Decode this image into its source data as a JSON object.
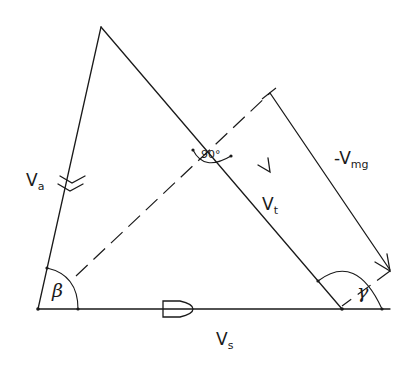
{
  "diagram": {
    "type": "velocity-triangle",
    "labels": {
      "va": {
        "main": "V",
        "sub": "a"
      },
      "vt": {
        "main": "V",
        "sub": "t"
      },
      "vs": {
        "main": "V",
        "sub": "s"
      },
      "vmg": {
        "main": "-V",
        "sub": "mg"
      },
      "beta": "β",
      "gamma": "γ",
      "right_angle": "90°"
    },
    "vertices": {
      "apex": [
        101,
        27
      ],
      "bottom_left": [
        38,
        309
      ],
      "bottom_right": [
        342,
        309
      ]
    },
    "colors": {
      "stroke": "#1a1a1a",
      "background": "#ffffff"
    }
  }
}
